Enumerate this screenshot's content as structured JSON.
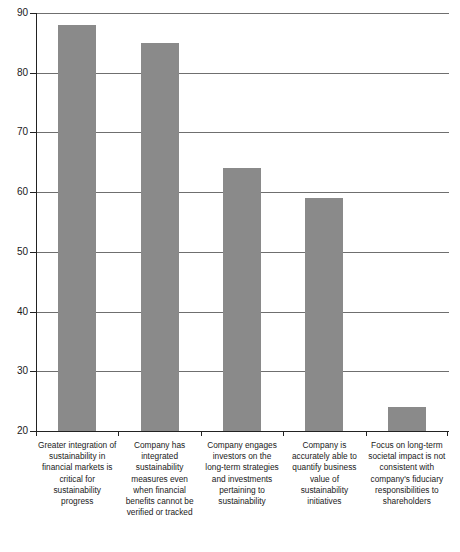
{
  "chart_data": {
    "type": "bar",
    "title": "",
    "subtitle": "",
    "xlabel": "",
    "ylabel": "",
    "ylim": [
      20,
      90
    ],
    "ytick_values": [
      20,
      30,
      40,
      50,
      60,
      70,
      80,
      90
    ],
    "ytick_labels": [
      "20",
      "30",
      "40",
      "50",
      "60",
      "70",
      "80",
      "90"
    ],
    "grid": true,
    "legend": false,
    "legend_position": "none",
    "bar_color": "#8a8a8a",
    "categories": [
      "Greater integration of sustainability in financial markets is critical for sustainability progress",
      "Company has integrated sustainability measures even when financial benefits cannot be verified or tracked",
      "Company engages investors on the long-term strategies and investments pertaining to sustainability",
      "Company is accurately able to quantify business value of sustainability initiatives",
      "Focus on long-term societal impact is not consistent with company's fiduciary responsibilities to shareholders"
    ],
    "values": [
      88,
      85,
      64,
      59,
      24
    ]
  }
}
